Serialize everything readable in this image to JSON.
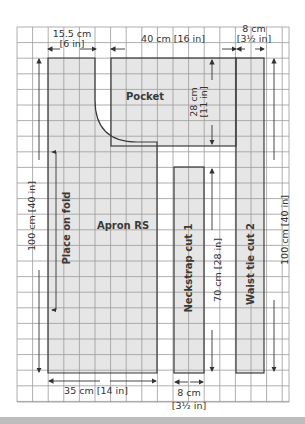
{
  "diagram": {
    "type": "sewing-pattern-layout",
    "grid": {
      "left": 17,
      "top": 27,
      "right": 289,
      "bottom": 402,
      "cell": 15.6,
      "line_color": "#9a9a9a",
      "background": "#ffffff"
    },
    "colors": {
      "piece_fill": "#e6e6e6",
      "piece_stroke": "#3b3b3b",
      "arrow": "#333333",
      "text": "#333333",
      "bottom_rule": "#bdbdbd"
    },
    "pieces": {
      "apron": {
        "label": "Apron RS"
      },
      "pocket": {
        "label": "Pocket"
      },
      "neckstrap": {
        "label": "Neckstrap  cut 1"
      },
      "waist_tie": {
        "label": "Waist tie  cut 2"
      }
    },
    "fold_label": "Place on fold",
    "dimensions": {
      "top_left_cm": "15.5 cm",
      "top_left_in": "[6 in]",
      "top_mid": "40 cm [16 in]",
      "top_right_cm": "8 cm",
      "top_right_in": "[3½ in]",
      "pocket_height_cm": "28 cm",
      "pocket_height_in": "[11 in]",
      "apron_height": "100 cm [40 in]",
      "neckstrap_length": "70 cm [28 in]",
      "waist_tie_length": "100 cm [40 in]",
      "apron_width": "35 cm [14 in]",
      "neckstrap_width_cm": "8 cm",
      "neckstrap_width_in": "[3½ in]"
    }
  }
}
